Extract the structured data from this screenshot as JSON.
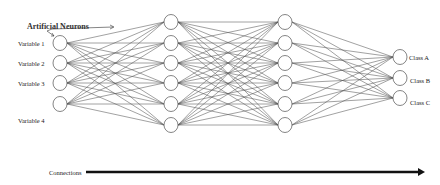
{
  "diagram": {
    "title_annotation": "Artificial Neurons",
    "inputs": [
      {
        "label": "Variable 1",
        "y": 43
      },
      {
        "label": "Variable 2",
        "y": 63
      },
      {
        "label": "Variable 3",
        "y": 83
      },
      {
        "label": "Variable 4",
        "y": 104
      }
    ],
    "hidden_layers": [
      {
        "x": 171,
        "nodes_y": [
          22,
          43,
          63,
          83,
          104,
          125
        ]
      },
      {
        "x": 285,
        "nodes_y": [
          22,
          43,
          63,
          83,
          104,
          125
        ]
      }
    ],
    "outputs": [
      {
        "label": "Class A",
        "y": 57
      },
      {
        "label": "Class B",
        "y": 78
      },
      {
        "label": "Class C",
        "y": 98
      }
    ],
    "input_x": 60,
    "output_x": 400,
    "node_radius": 7,
    "arrow": {
      "label": "Connections",
      "x1": 86,
      "x2": 425,
      "y": 172
    },
    "colors": {
      "edge": "#555555",
      "node_stroke": "#666666",
      "arrow": "#111111"
    }
  }
}
